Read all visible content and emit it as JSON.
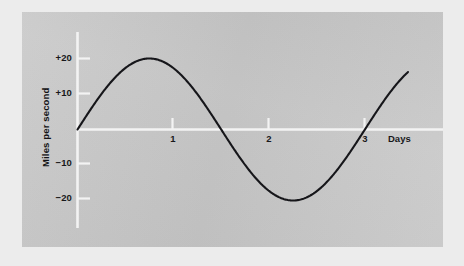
{
  "figure": {
    "background_color": "#ececec",
    "panel_color": "#c9c9c9",
    "axis_color": "#f2f2f2",
    "curve_color": "#16161a"
  },
  "chart_data": {
    "type": "line",
    "title": "",
    "subtitle": "",
    "xlabel": "Days",
    "ylabel": "Miles per second",
    "xlim": [
      0,
      3.45
    ],
    "ylim": [
      -24,
      24
    ],
    "x_ticks": [
      1,
      2,
      3
    ],
    "x_tick_labels": [
      "1",
      "2",
      "3"
    ],
    "y_ticks": [
      20,
      10,
      -10,
      -20
    ],
    "y_tick_labels": [
      "+20",
      "+10",
      "−10",
      "−20"
    ],
    "grid": false,
    "legend": null,
    "annotations": [],
    "series": [
      {
        "name": "velocity",
        "description": "Sinusoidal velocity curve, amplitude 20 miles per second, period about 3 days, starting at 0 and rising.",
        "amplitude": 20,
        "period_days": 3,
        "phase": 0,
        "x": [
          0,
          0.1,
          0.2,
          0.3,
          0.4,
          0.5,
          0.6,
          0.7,
          0.75,
          0.8,
          0.9,
          1.0,
          1.1,
          1.2,
          1.3,
          1.4,
          1.5,
          1.6,
          1.7,
          1.8,
          1.9,
          2.0,
          2.1,
          2.2,
          2.25,
          2.3,
          2.4,
          2.5,
          2.6,
          2.7,
          2.8,
          2.9,
          3.0,
          3.1,
          3.2,
          3.3,
          3.4
        ],
        "y": [
          0,
          4.2,
          8.1,
          11.8,
          14.9,
          17.3,
          19.0,
          19.9,
          20.0,
          19.9,
          19.0,
          17.3,
          14.9,
          11.8,
          8.1,
          4.2,
          0.0,
          -4.2,
          -8.1,
          -11.8,
          -14.9,
          -17.3,
          -19.0,
          -19.9,
          -20.0,
          -19.9,
          -19.0,
          -17.3,
          -14.9,
          -11.8,
          -8.1,
          -4.2,
          0.0,
          4.2,
          8.1,
          11.8,
          14.9
        ]
      }
    ]
  },
  "axis_labels": {
    "y_plus_20": "+20",
    "y_plus_10": "+10",
    "y_minus_10": "−10",
    "y_minus_20": "−20",
    "x_1": "1",
    "x_2": "2",
    "x_3": "3",
    "x_axis_title": "Days",
    "y_axis_title": "Miles per second"
  }
}
